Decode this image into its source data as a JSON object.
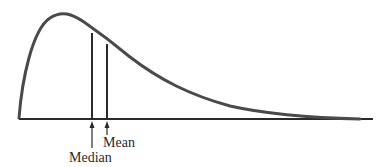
{
  "diagram": {
    "type": "right-skewed distribution",
    "labels": {
      "median": "Median",
      "mean": "Mean"
    },
    "colors": {
      "curve": "#4a4a4a",
      "axis": "#2a2a2a",
      "text": "#2a2a2a"
    }
  }
}
